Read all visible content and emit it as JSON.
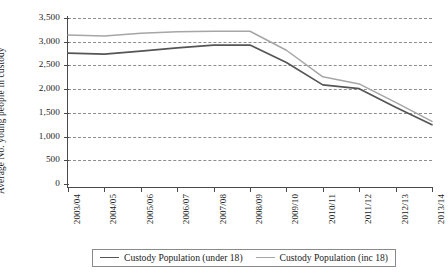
{
  "chart_data": {
    "type": "line",
    "title": "",
    "xlabel": "",
    "ylabel": "Average No. young people in custody",
    "categories": [
      "2003/04",
      "2004/05",
      "2005/06",
      "2006/07",
      "2007/08",
      "2008/09",
      "2009/10",
      "2010/11",
      "2011/12",
      "2012/13",
      "2013/14"
    ],
    "yticks": [
      0,
      500,
      1000,
      1500,
      2000,
      2500,
      3000,
      3500
    ],
    "ytick_labels": [
      "0",
      "500",
      "1,000",
      "1,500",
      "2,000",
      "2,500",
      "3,000",
      "3,500"
    ],
    "ylim": [
      0,
      3500
    ],
    "grid": true,
    "legend_position": "bottom",
    "series": [
      {
        "name": "Custody Population (under 18)",
        "color": "#555555",
        "values": [
          2760,
          2740,
          2800,
          2870,
          2930,
          2930,
          2560,
          2090,
          2010,
          1620,
          1250
        ]
      },
      {
        "name": "Custody Population (inc 18)",
        "color": "#a6a6a6",
        "values": [
          3140,
          3120,
          3180,
          3210,
          3220,
          3220,
          2820,
          2260,
          2110,
          1720,
          1320
        ]
      }
    ]
  },
  "legend": {
    "items": [
      {
        "label": "Custody Population (under 18)"
      },
      {
        "label": "Custody Population (inc 18)"
      }
    ]
  }
}
